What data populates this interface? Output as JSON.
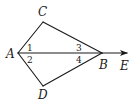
{
  "diagram": {
    "type": "geometry-figure",
    "points": {
      "A": {
        "label": "A",
        "x": 18,
        "y": 53
      },
      "B": {
        "label": "B",
        "x": 102,
        "y": 53
      },
      "C": {
        "label": "C",
        "x": 43,
        "y": 22
      },
      "D": {
        "label": "D",
        "x": 43,
        "y": 86
      },
      "E": {
        "label": "E",
        "x": 128,
        "y": 53
      }
    },
    "segments": [
      "AC",
      "CB",
      "AD",
      "DB",
      "AB"
    ],
    "rays": [
      "BE"
    ],
    "angle_labels": {
      "a1": "1",
      "a2": "2",
      "a3": "3",
      "a4": "4"
    },
    "colors": {
      "stroke": "#1a1a1a",
      "background": "#ffffff"
    }
  }
}
